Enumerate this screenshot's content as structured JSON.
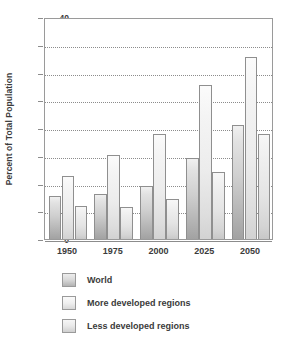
{
  "chart_data": {
    "type": "bar",
    "title": "",
    "xlabel": "",
    "ylabel": "Percent of Total Population",
    "categories": [
      "1950",
      "1975",
      "2000",
      "2025",
      "2050"
    ],
    "series": [
      {
        "name": "World",
        "values": [
          7.8,
          8.1,
          9.6,
          14.6,
          20.6
        ],
        "color": "#c0c0c0"
      },
      {
        "name": "More developed regions",
        "values": [
          11.4,
          15.1,
          19.0,
          27.7,
          32.8
        ],
        "color": "#e8e8e8"
      },
      {
        "name": "Less developed regions",
        "values": [
          6.0,
          5.8,
          7.2,
          12.0,
          18.9
        ],
        "color": "#dcdcdc"
      }
    ],
    "ylim": [
      0,
      40
    ],
    "ytick_step": 5,
    "ytick_labels": [
      "0",
      "5",
      "10",
      "15",
      "20",
      "25",
      "30",
      "35",
      "40"
    ],
    "grid": true,
    "grid_style": "dotted",
    "legend_position": "bottom-left",
    "bar_style": "vertical-gradient-outlined"
  },
  "legend": {
    "items": [
      {
        "label": "World"
      },
      {
        "label": "More developed regions"
      },
      {
        "label": "Less developed regions"
      }
    ]
  },
  "colors": {
    "axis": "#8c8c8c",
    "border": "#9a9a9a",
    "text": "#3b3b3b",
    "background": "#ffffff"
  }
}
